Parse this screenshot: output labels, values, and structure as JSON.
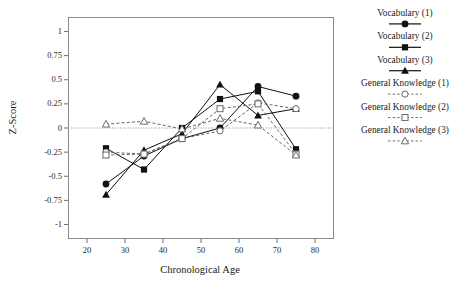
{
  "chart_data": {
    "type": "line",
    "title": "",
    "xlabel": "Chronological Age",
    "ylabel": "Z-Score",
    "xlim": [
      15,
      85
    ],
    "ylim": [
      -1.15,
      1.15
    ],
    "xticks": [
      20,
      30,
      40,
      50,
      60,
      70,
      80
    ],
    "yticks": [
      1,
      0.75,
      0.5,
      0.25,
      0,
      -0.25,
      -0.5,
      -0.75,
      -1
    ],
    "ytick_labels": [
      "1",
      "0.75",
      "0.5",
      "0.25",
      "0",
      "-0.25",
      "-0.5",
      "-0.75",
      "-1"
    ],
    "xtick_labels": [
      "20",
      "30",
      "40",
      "50",
      "60",
      "70",
      "80"
    ],
    "grid": false,
    "zero_line": true,
    "legend_position": "right",
    "x": [
      25,
      35,
      45,
      55,
      65,
      75
    ],
    "series": [
      {
        "name": "Vocabulary (1)",
        "marker": "filled-circle",
        "linestyle": "solid",
        "color": "#111111",
        "values": [
          -0.58,
          -0.29,
          -0.11,
          0.0,
          0.43,
          0.33
        ]
      },
      {
        "name": "Vocabulary (2)",
        "marker": "filled-square",
        "linestyle": "solid",
        "color": "#111111",
        "values": [
          -0.21,
          -0.43,
          0.0,
          0.3,
          0.38,
          -0.22
        ]
      },
      {
        "name": "Vocabulary (3)",
        "marker": "filled-triangle",
        "linestyle": "solid",
        "color": "#111111",
        "values": [
          -0.69,
          -0.23,
          -0.06,
          0.45,
          0.13,
          0.2
        ]
      },
      {
        "name": "General Knowledge (1)",
        "marker": "open-circle",
        "linestyle": "dashed",
        "color": "#555555",
        "values": [
          -0.25,
          -0.27,
          -0.11,
          -0.03,
          0.26,
          0.2
        ]
      },
      {
        "name": "General Knowledge (2)",
        "marker": "open-square",
        "linestyle": "dashed",
        "color": "#555555",
        "values": [
          -0.28,
          -0.27,
          -0.11,
          0.2,
          0.25,
          -0.27
        ]
      },
      {
        "name": "General Knowledge (3)",
        "marker": "open-triangle",
        "linestyle": "dashed",
        "color": "#555555",
        "values": [
          0.04,
          0.07,
          -0.01,
          0.1,
          0.03,
          -0.28
        ]
      }
    ]
  },
  "legend": {
    "entries": [
      {
        "label": "Vocabulary (1)",
        "marker": "filled-circle",
        "linestyle": "solid"
      },
      {
        "label": "Vocabulary (2)",
        "marker": "filled-square",
        "linestyle": "solid"
      },
      {
        "label": "Vocabulary (3)",
        "marker": "filled-triangle",
        "linestyle": "solid"
      },
      {
        "label": "General Knowledge (1)",
        "marker": "open-circle",
        "linestyle": "dashed"
      },
      {
        "label": "General Knowledge (2)",
        "marker": "open-square",
        "linestyle": "dashed"
      },
      {
        "label": "General Knowledge (3)",
        "marker": "open-triangle",
        "linestyle": "dashed"
      }
    ]
  }
}
